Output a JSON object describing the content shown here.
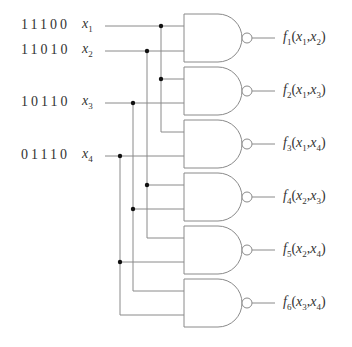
{
  "inputs": [
    {
      "bits": "11100",
      "var": "x",
      "sub": "1",
      "y": 26
    },
    {
      "bits": "11010",
      "var": "x",
      "sub": "2",
      "y": 51
    },
    {
      "bits": "10110",
      "var": "x",
      "sub": "3",
      "y": 103
    },
    {
      "bits": "01110",
      "var": "x",
      "sub": "4",
      "y": 156
    }
  ],
  "gates": [
    {
      "type": "NAND",
      "top": 14,
      "inputs": [
        "x1",
        "x2"
      ],
      "out_f": "f",
      "out_sub": "1",
      "a": "x",
      "a_sub": "1",
      "b": "x",
      "b_sub": "2"
    },
    {
      "type": "NAND",
      "top": 67,
      "inputs": [
        "x1",
        "x3"
      ],
      "out_f": "f",
      "out_sub": "2",
      "a": "x",
      "a_sub": "1",
      "b": "x",
      "b_sub": "3"
    },
    {
      "type": "NAND",
      "top": 120,
      "inputs": [
        "x1",
        "x4"
      ],
      "out_f": "f",
      "out_sub": "3",
      "a": "x",
      "a_sub": "1",
      "b": "x",
      "b_sub": "4"
    },
    {
      "type": "NAND",
      "top": 173,
      "inputs": [
        "x2",
        "x3"
      ],
      "out_f": "f",
      "out_sub": "4",
      "a": "x",
      "a_sub": "2",
      "b": "x",
      "b_sub": "3"
    },
    {
      "type": "NAND",
      "top": 226,
      "inputs": [
        "x2",
        "x4"
      ],
      "out_f": "f",
      "out_sub": "5",
      "a": "x",
      "a_sub": "2",
      "b": "x",
      "b_sub": "4"
    },
    {
      "type": "NAND",
      "top": 279,
      "inputs": [
        "x3",
        "x4"
      ],
      "out_f": "f",
      "out_sub": "6",
      "a": "x",
      "a_sub": "3",
      "b": "x",
      "b_sub": "4"
    }
  ],
  "colors": {
    "wire": "#8a8a8a",
    "junction": "#111111",
    "text": "#333333"
  }
}
